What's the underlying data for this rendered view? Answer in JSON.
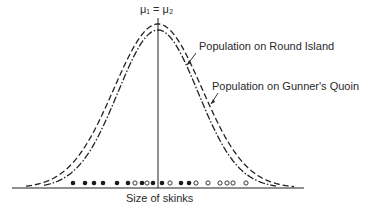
{
  "figure": {
    "mean_label": "μ₁ = μ₂",
    "curve_labels": {
      "round_island": "Population on Round Island",
      "gunners_quoin": "Population on Gunner's Quoin"
    },
    "x_axis_label": "Size of skinks"
  },
  "chart_data": {
    "type": "line",
    "title": "",
    "xlabel": "Size of skinks",
    "ylabel": "",
    "annotations": [
      "μ₁ = μ₂",
      "Population on Round Island",
      "Population on Gunner's Quoin"
    ],
    "series": [
      {
        "name": "Population on Round Island",
        "style": "dashed",
        "shape": "normal",
        "mean": "μ₁",
        "relative_height": 1.0
      },
      {
        "name": "Population on Gunner's Quoin",
        "style": "dash-dot",
        "shape": "normal",
        "mean": "μ₂",
        "relative_height": 0.96
      }
    ],
    "sample_points": {
      "filled": [
        73,
        85,
        94,
        103,
        117,
        128,
        142,
        153,
        162,
        181,
        189
      ],
      "open": [
        135,
        147,
        170,
        196,
        208,
        220,
        227,
        233,
        246
      ]
    },
    "grid": false,
    "legend": "inline annotations with arrows"
  }
}
